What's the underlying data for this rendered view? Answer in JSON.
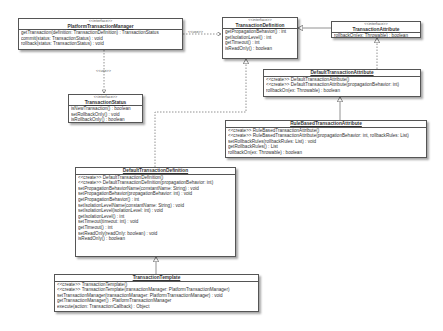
{
  "diagram": {
    "type": "UML class diagram",
    "classes": {
      "platformTransactionManager": {
        "stereotype": "<<interface>>",
        "name": "PlatformTransactionManager",
        "members": [
          "getTransaction(definition: TransactionDefinition) : TransactionStatus",
          "commit(status: TransactionStatus) : void",
          "rollback(status: TransactionStatus) : void"
        ]
      },
      "transactionStatus": {
        "stereotype": "<<interface>>",
        "name": "TransactionStatus",
        "members": [
          "isNewTransaction() : boolean",
          "setRollbackOnly() : void",
          "isRollbackOnly() : boolean"
        ]
      },
      "transactionDefinition": {
        "stereotype": "<<interface>>",
        "name": "TransactionDefinition",
        "members": [
          "getPropagationBehavior() : int",
          "getIsolationLevel() : int",
          "getTimeout() : int",
          "isReadOnly() : boolean"
        ]
      },
      "transactionAttribute": {
        "stereotype": "<<interface>>",
        "name": "TransactionAttribute",
        "members": [
          "rollbackOn(ex: Throwable) : boolean"
        ]
      },
      "defaultTransactionAttribute": {
        "name": "DefaultTransactionAttribute",
        "members": [
          "<<create>> DefaultTransactionAttribute()",
          "<<create>> DefaultTransactionAttribute(propagationBehavior: int)",
          "rollbackOn(ex: Throwable) : boolean"
        ]
      },
      "ruleBasedTransactionAttribute": {
        "name": "RuleBasedTransactionAttribute",
        "members": [
          "<<create>> RuleBasedTransactionAttribute()",
          "<<create>> RuleBasedTransactionAttribute(propagationBehavior: int, rollbackRules: List)",
          "setRollbackRules(rollbackRules: List) : void",
          "getRollbackRules() : List",
          "rollbackOn(ex: Throwable) : boolean"
        ]
      },
      "defaultTransactionDefinition": {
        "name": "DefaultTransactionDefinition",
        "members": [
          "<<create>> DefaultTransactionDefinition()",
          "<<create>> DefaultTransactionDefinition(propagationBehavior: int)",
          "setPropagationBehaviorName(constantName: String) : void",
          "setPropagationBehavior(propagationBehavior: int) : void",
          "getPropagationBehavior() : int",
          "setIsolationLevelName(constantName: String) : void",
          "setIsolationLevel(isolationLevel: int) : void",
          "getIsolationLevel() : int",
          "setTimeout(timeout: int) : void",
          "getTimeout() : int",
          "setReadOnly(readOnly: boolean) : void",
          "isReadOnly() : boolean"
        ]
      },
      "transactionTemplate": {
        "name": "TransactionTemplate",
        "members": [
          "<<create>> TransactionTemplate()",
          "<<create>> TransactionTemplate(transactionManager: PlatformTransactionManager)",
          "setTransactionManager(transactionManager: PlatformTransactionManager) : void",
          "getTransactionManager() : PlatformTransactionManager",
          "execute(action: TransactionCallback) : Object"
        ]
      }
    },
    "relations": {
      "ptm_to_def_label": "<<use>>",
      "ptm_to_status_label": "<<use>>"
    }
  }
}
